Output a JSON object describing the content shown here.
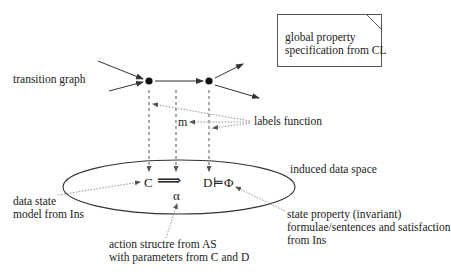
{
  "diagram": {
    "labels": {
      "transition_graph": "transition graph",
      "labels_function": "labels function",
      "m": "m",
      "induced_data_space": "induced data space",
      "data_state_line1": "data state",
      "data_state_line2": "model from Ins",
      "action_line1": "action structre from AS",
      "action_line2": "with parameters from C and D",
      "state_prop_line1": "state property (invariant)",
      "state_prop_line2": "formulae/sentences and satisfaction",
      "state_prop_line3": "from Ins"
    },
    "global_box": {
      "line1": "global property",
      "line2": "specification from CL"
    },
    "math": {
      "c": "C",
      "arrow": "⟹",
      "alpha": "α",
      "d": "D",
      "models": "⊨",
      "phi": "Φ"
    },
    "nodes": [
      {
        "id": "state-1",
        "x": 149,
        "y": 81
      },
      {
        "id": "state-2",
        "x": 209,
        "y": 81
      }
    ],
    "colors": {
      "stroke": "#333333",
      "dotted": "#777777",
      "background": "#ffffff"
    }
  }
}
